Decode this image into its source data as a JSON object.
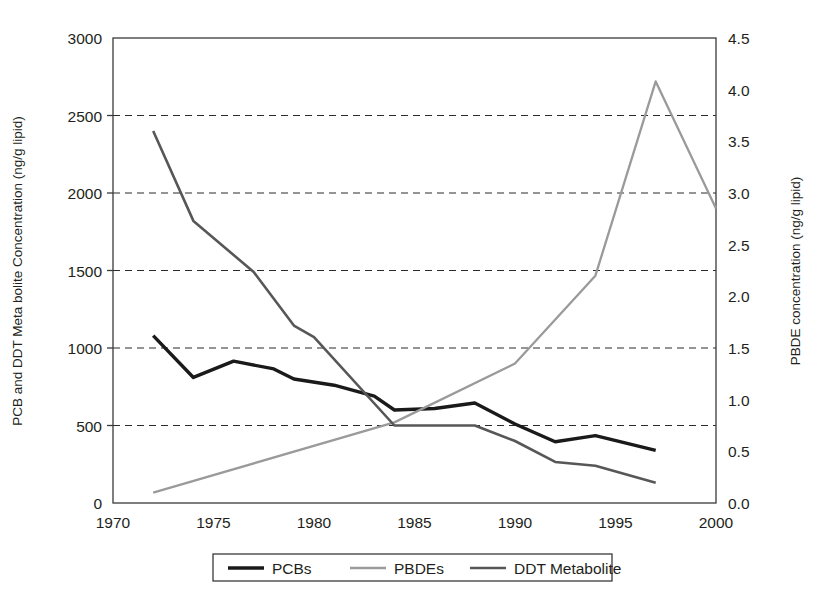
{
  "chart_data": {
    "type": "line",
    "title": "",
    "xlabel": "",
    "ylabel": "PCB and DDT Meta bolite Concentration (ng/g lipid)",
    "y2label": "PBDE concentration (ng/g lipid)",
    "xlim": [
      1970,
      2000
    ],
    "ylim": [
      0,
      3000
    ],
    "y2lim": [
      0.0,
      4.5
    ],
    "grid": true,
    "grid_axis": "y",
    "legend_position": "bottom-outside",
    "xticks": [
      "1970",
      "1975",
      "1980",
      "1985",
      "1990",
      "1995",
      "2000"
    ],
    "xtick_values": [
      1970,
      1975,
      1980,
      1985,
      1990,
      1995,
      2000
    ],
    "yticks": [
      "0",
      "500",
      "1000",
      "1500",
      "2000",
      "2500",
      "3000"
    ],
    "ytick_values": [
      0,
      500,
      1000,
      1500,
      2000,
      2500,
      3000
    ],
    "y2ticks": [
      "0.0",
      "0.5",
      "1.0",
      "1.5",
      "2.0",
      "2.5",
      "3.0",
      "3.5",
      "4.0",
      "4.5"
    ],
    "y2tick_values": [
      0.0,
      0.5,
      1.0,
      1.5,
      2.0,
      2.5,
      3.0,
      3.5,
      4.0,
      4.5
    ],
    "gridline_values": [
      500,
      1000,
      1500,
      2000,
      2500
    ],
    "series": [
      {
        "name": "PCBs",
        "axis": "left",
        "color": "#1a1a1a",
        "width": 3.4,
        "x": [
          1972,
          1974,
          1976,
          1978,
          1979,
          1981,
          1983,
          1984,
          1986,
          1988,
          1990,
          1992,
          1994,
          1997
        ],
        "values": [
          1080,
          810,
          915,
          865,
          800,
          760,
          690,
          600,
          610,
          645,
          510,
          395,
          435,
          340
        ]
      },
      {
        "name": "PBDEs",
        "axis": "right",
        "color": "#9a9a9a",
        "width": 2.3,
        "x": [
          1972,
          1984,
          1990,
          1994,
          1997,
          2000
        ],
        "values": [
          0.1,
          0.78,
          1.35,
          2.2,
          4.08,
          2.85
        ]
      },
      {
        "name": "DDT Metabolite",
        "axis": "left",
        "color": "#575757",
        "width": 2.6,
        "x": [
          1972,
          1974,
          1977,
          1979,
          1980,
          1984,
          1988,
          1990,
          1992,
          1994,
          1997
        ],
        "values": [
          2400,
          1820,
          1490,
          1145,
          1070,
          500,
          500,
          400,
          265,
          240,
          130
        ]
      }
    ],
    "legend": [
      {
        "label": "PCBs",
        "color": "#1a1a1a",
        "width": 3.4
      },
      {
        "label": "PBDEs",
        "color": "#9a9a9a",
        "width": 2.3
      },
      {
        "label": "DDT Metabolite",
        "color": "#575757",
        "width": 2.6
      }
    ]
  }
}
